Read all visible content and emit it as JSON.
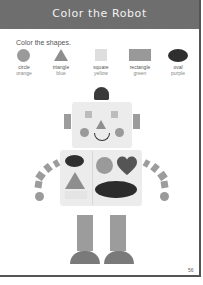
{
  "header": {
    "title": "Color the Robot"
  },
  "instructions": "Color the shapes.",
  "key": [
    {
      "shape": "circle",
      "color": "orange"
    },
    {
      "shape": "triangle",
      "color": "blue"
    },
    {
      "shape": "square",
      "color": "yellow"
    },
    {
      "shape": "rectangle",
      "color": "green"
    },
    {
      "shape": "oval",
      "color": "purple"
    }
  ],
  "page_number": "56"
}
